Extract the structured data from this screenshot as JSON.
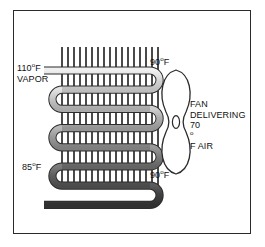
{
  "figure": {
    "border_color": "#2b2b2b",
    "background": "#ffffff"
  },
  "labels": {
    "vapor_inlet": {
      "line1_value": "110",
      "line1_unit": "o",
      "line1_suffix": "F",
      "line2": "VAPOR",
      "full": "110oF VAPOR"
    },
    "liquid_outlet": {
      "value": "85",
      "unit": "o",
      "suffix": "F",
      "full": "85oF"
    },
    "air_out_top": {
      "value": "90",
      "unit": "o",
      "suffix": "F",
      "full": "90oF"
    },
    "air_out_bottom": {
      "value": "90",
      "unit": "o",
      "suffix": "F",
      "full": "90oF"
    },
    "fan": {
      "line1": "FAN",
      "line2": "DELIVERING",
      "line3_value": "70",
      "line3_unit": "o",
      "line3_suffix": "F AIR",
      "full": "FAN DELIVERING 70oF AIR"
    }
  },
  "coil": {
    "name": "condenser-coil",
    "runs": 7,
    "tube_colors": [
      "#d6d6d6",
      "#c3c3c3",
      "#ababab",
      "#959595",
      "#7a7a7a",
      "#5f5f5f",
      "#3f3f3f"
    ],
    "tube_outline": "#2b2b2b",
    "fin_color": "#4a4a4a",
    "fin_count": 17
  },
  "fan": {
    "name": "cooling-fan",
    "outline": "#2b2b2b",
    "fill": "#ffffff",
    "hub": "ellipse"
  }
}
